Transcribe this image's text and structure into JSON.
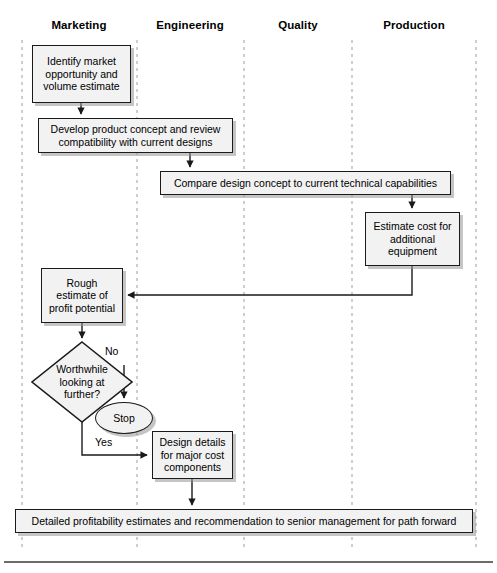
{
  "diagram": {
    "type": "swimlane-flowchart",
    "width": 497,
    "height": 573,
    "colors": {
      "node_fill": "#f2f2f2",
      "node_stroke": "#1a1a1a",
      "shadow": "#969696",
      "lane_divider": "#b4b4b4",
      "baseline": "#333333",
      "background": "#ffffff"
    },
    "lanes": [
      {
        "id": "marketing",
        "label": "Marketing",
        "center_x": 79
      },
      {
        "id": "engineering",
        "label": "Engineering",
        "center_x": 190
      },
      {
        "id": "quality",
        "label": "Quality",
        "center_x": 298
      },
      {
        "id": "production",
        "label": "Production",
        "center_x": 414
      }
    ],
    "lane_dividers_x": [
      22,
      137,
      244,
      352,
      476
    ],
    "lane_divider_top": 40,
    "lane_divider_bottom": 547,
    "baseline_y": 562,
    "nodes": [
      {
        "id": "n1",
        "shape": "process",
        "lane": "marketing",
        "text": "Identify market opportunity and volume estimate",
        "x": 32,
        "y": 45,
        "w": 99,
        "h": 58
      },
      {
        "id": "n2",
        "shape": "process",
        "lane": "marketing-engineering",
        "text": "Develop product concept and review compatibility with current designs",
        "x": 38,
        "y": 118,
        "w": 195,
        "h": 35
      },
      {
        "id": "n3",
        "shape": "process",
        "lane": "engineering-quality-production",
        "text": "Compare design concept to current technical capabilities",
        "x": 160,
        "y": 171,
        "w": 291,
        "h": 24
      },
      {
        "id": "n4",
        "shape": "process",
        "lane": "production",
        "text": "Estimate cost for additional equipment",
        "x": 365,
        "y": 212,
        "w": 95,
        "h": 54
      },
      {
        "id": "n5",
        "shape": "process",
        "lane": "marketing",
        "text": "Rough estimate of profit potential",
        "x": 41,
        "y": 268,
        "w": 82,
        "h": 55
      },
      {
        "id": "n6",
        "shape": "decision",
        "lane": "marketing",
        "text": "Worthwhile looking at further?",
        "cx": 82,
        "cy": 382,
        "rx": 50,
        "ry": 40
      },
      {
        "id": "n7",
        "shape": "terminator",
        "lane": "marketing",
        "text": "Stop",
        "x": 95,
        "y": 402,
        "w": 58,
        "h": 32
      },
      {
        "id": "n8",
        "shape": "process",
        "lane": "engineering",
        "text": "Design details for major cost components",
        "x": 152,
        "y": 431,
        "w": 81,
        "h": 48
      },
      {
        "id": "n9",
        "shape": "process",
        "lane": "all",
        "text": "Detailed profitability estimates and recommendation to senior management for path forward",
        "x": 15,
        "y": 509,
        "w": 458,
        "h": 24
      }
    ],
    "edge_labels": [
      {
        "id": "no",
        "text": "No",
        "x": 105,
        "y": 352
      },
      {
        "id": "yes",
        "text": "Yes",
        "x": 95,
        "y": 443
      }
    ]
  }
}
